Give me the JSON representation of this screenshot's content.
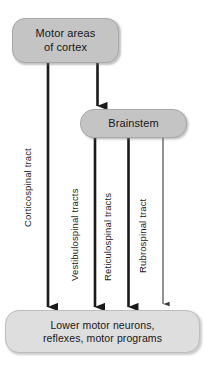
{
  "diagram": {
    "background_color": "#ffffff",
    "line_color": "#1a1a1a",
    "nodes": [
      {
        "id": "cortex",
        "label": "Motor areas\nof cortex",
        "fill": "#c4c4c4",
        "shape": "rounded-rectangle"
      },
      {
        "id": "brainstem",
        "label": "Brainstem",
        "fill": "#c4c4c4",
        "shape": "rounded-rectangle"
      },
      {
        "id": "lower_motor",
        "label": "Lower motor neurons,\nreflexes, motor programs",
        "fill": "#dedede",
        "shape": "rounded-rectangle"
      }
    ],
    "connectors": [
      {
        "id": "cortex-to-brainstem",
        "label": "",
        "from": "cortex",
        "to": "brainstem",
        "weight": "thick"
      },
      {
        "id": "corticospinal",
        "label": "Corticospinal tract",
        "from": "cortex",
        "to": "lower_motor",
        "weight": "thick"
      },
      {
        "id": "vestibulospinal",
        "label": "Vestibulospinal tracts",
        "from": "brainstem",
        "to": "lower_motor",
        "weight": "thick"
      },
      {
        "id": "reticulospinal",
        "label": "Reticulospinal tracts",
        "from": "brainstem",
        "to": "lower_motor",
        "weight": "thick"
      },
      {
        "id": "rubrospinal",
        "label": "Rubrospinal tract",
        "from": "brainstem",
        "to": "lower_motor",
        "weight": "thin"
      }
    ]
  }
}
